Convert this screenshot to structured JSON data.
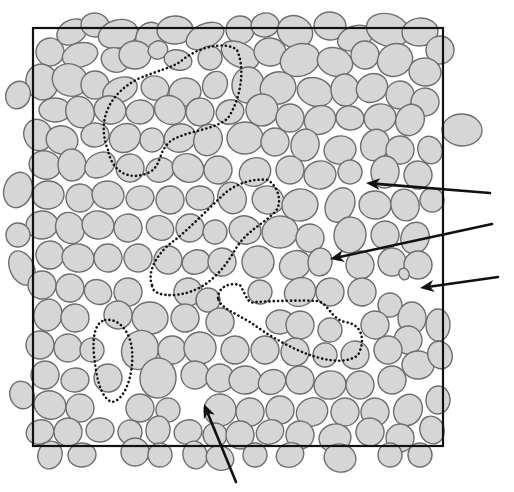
{
  "figure": {
    "width": 514,
    "height": 492,
    "colors": {
      "background": "#ffffff",
      "grain_fill": "#d6d6d6",
      "grain_stroke": "#6e6e6e",
      "frame": "#111111",
      "cluster_outline": "#151515",
      "arrow": "#111111"
    },
    "frame": {
      "x": 33,
      "y": 28,
      "width": 410,
      "height": 418
    },
    "clusters": [
      {
        "name": "cluster-top",
        "d": "M108,150 C96,120 110,92 140,78 C160,70 170,68 180,62 C195,48 225,40 237,50 C246,70 240,100 228,118 C215,130 190,130 172,140 C158,150 162,165 150,172 C130,182 112,172 108,150 Z"
      },
      {
        "name": "cluster-middle",
        "d": "M152,285 C146,270 160,250 175,240 C190,228 205,212 220,198 C232,185 250,178 268,180 C280,188 282,205 275,212 C262,225 245,232 235,250 C222,272 205,292 175,295 C160,296 152,292 152,285 Z"
      },
      {
        "name": "cluster-right",
        "d": "M218,298 C218,288 228,282 240,285 C246,295 248,305 255,302 C275,301 300,300 318,301 C330,305 330,318 345,322 C362,324 366,340 358,355 C345,365 325,360 310,355 C290,348 268,335 250,322 C235,313 220,308 218,298 Z"
      },
      {
        "name": "cluster-left-bottom",
        "d": "M105,320 C118,318 130,330 132,350 C134,375 125,400 112,402 C100,398 96,375 94,355 C92,335 96,322 105,320 Z"
      }
    ],
    "arrows": [
      {
        "name": "arrow-pore-upper-right",
        "x1": 490,
        "y1": 193,
        "x2": 366,
        "y2": 183
      },
      {
        "name": "arrow-pore-center-right",
        "x1": 492,
        "y1": 224,
        "x2": 330,
        "y2": 259
      },
      {
        "name": "arrow-pore-right-edge",
        "x1": 498,
        "y1": 277,
        "x2": 420,
        "y2": 288
      },
      {
        "name": "arrow-pore-bottom",
        "x1": 236,
        "y1": 482,
        "x2": 204,
        "y2": 404
      }
    ],
    "grains": [
      [
        72,
        32,
        16,
        12
      ],
      [
        95,
        25,
        14,
        12
      ],
      [
        118,
        34,
        20,
        14
      ],
      [
        150,
        38,
        14,
        16
      ],
      [
        175,
        30,
        18,
        14
      ],
      [
        205,
        36,
        20,
        12
      ],
      [
        240,
        30,
        14,
        14
      ],
      [
        265,
        25,
        14,
        12
      ],
      [
        295,
        32,
        18,
        16
      ],
      [
        330,
        26,
        16,
        14
      ],
      [
        355,
        38,
        18,
        12
      ],
      [
        388,
        30,
        22,
        16
      ],
      [
        420,
        32,
        18,
        14
      ],
      [
        440,
        50,
        14,
        14
      ],
      [
        50,
        52,
        14,
        14
      ],
      [
        80,
        55,
        18,
        12
      ],
      [
        115,
        60,
        14,
        12
      ],
      [
        135,
        55,
        16,
        14
      ],
      [
        158,
        50,
        10,
        9
      ],
      [
        178,
        60,
        14,
        10
      ],
      [
        210,
        58,
        12,
        12
      ],
      [
        240,
        55,
        20,
        12
      ],
      [
        270,
        52,
        16,
        14
      ],
      [
        300,
        60,
        20,
        16
      ],
      [
        335,
        62,
        18,
        14
      ],
      [
        365,
        55,
        14,
        14
      ],
      [
        395,
        60,
        18,
        16
      ],
      [
        425,
        72,
        16,
        14
      ],
      [
        42,
        82,
        16,
        18
      ],
      [
        70,
        80,
        18,
        16
      ],
      [
        95,
        85,
        14,
        14
      ],
      [
        120,
        90,
        18,
        12
      ],
      [
        155,
        88,
        14,
        12
      ],
      [
        185,
        92,
        16,
        14
      ],
      [
        215,
        85,
        12,
        14
      ],
      [
        248,
        85,
        16,
        18
      ],
      [
        278,
        88,
        18,
        16
      ],
      [
        315,
        92,
        18,
        14
      ],
      [
        345,
        90,
        14,
        16
      ],
      [
        372,
        88,
        16,
        14
      ],
      [
        400,
        95,
        14,
        14
      ],
      [
        425,
        102,
        14,
        14
      ],
      [
        18,
        95,
        12,
        14
      ],
      [
        55,
        110,
        16,
        12
      ],
      [
        80,
        112,
        14,
        16
      ],
      [
        110,
        110,
        16,
        14
      ],
      [
        140,
        112,
        14,
        12
      ],
      [
        170,
        110,
        16,
        14
      ],
      [
        200,
        112,
        14,
        14
      ],
      [
        230,
        112,
        14,
        12
      ],
      [
        262,
        110,
        16,
        16
      ],
      [
        290,
        118,
        14,
        14
      ],
      [
        320,
        120,
        16,
        14
      ],
      [
        350,
        118,
        14,
        12
      ],
      [
        380,
        118,
        16,
        14
      ],
      [
        410,
        120,
        14,
        16
      ],
      [
        462,
        130,
        20,
        16
      ],
      [
        38,
        135,
        14,
        16
      ],
      [
        62,
        140,
        16,
        14
      ],
      [
        95,
        135,
        14,
        12
      ],
      [
        125,
        138,
        16,
        14
      ],
      [
        152,
        140,
        12,
        12
      ],
      [
        180,
        138,
        16,
        14
      ],
      [
        208,
        140,
        14,
        16
      ],
      [
        245,
        138,
        18,
        16
      ],
      [
        275,
        142,
        14,
        14
      ],
      [
        305,
        145,
        14,
        16
      ],
      [
        340,
        150,
        16,
        14
      ],
      [
        375,
        145,
        14,
        16
      ],
      [
        400,
        150,
        14,
        14
      ],
      [
        430,
        150,
        12,
        14
      ],
      [
        45,
        165,
        16,
        14
      ],
      [
        72,
        165,
        14,
        16
      ],
      [
        100,
        165,
        16,
        12
      ],
      [
        130,
        168,
        14,
        14
      ],
      [
        160,
        170,
        14,
        12
      ],
      [
        188,
        168,
        16,
        14
      ],
      [
        218,
        170,
        14,
        14
      ],
      [
        255,
        172,
        16,
        14
      ],
      [
        290,
        170,
        14,
        14
      ],
      [
        320,
        175,
        16,
        14
      ],
      [
        350,
        172,
        12,
        12
      ],
      [
        385,
        172,
        14,
        16
      ],
      [
        418,
        175,
        14,
        14
      ],
      [
        18,
        190,
        14,
        18
      ],
      [
        48,
        195,
        16,
        14
      ],
      [
        80,
        198,
        14,
        14
      ],
      [
        108,
        195,
        16,
        14
      ],
      [
        140,
        198,
        14,
        12
      ],
      [
        170,
        200,
        14,
        14
      ],
      [
        200,
        198,
        14,
        12
      ],
      [
        232,
        198,
        14,
        16
      ],
      [
        268,
        200,
        16,
        14
      ],
      [
        300,
        205,
        18,
        16
      ],
      [
        340,
        205,
        14,
        18
      ],
      [
        375,
        205,
        16,
        14
      ],
      [
        405,
        205,
        14,
        16
      ],
      [
        432,
        200,
        12,
        12
      ],
      [
        42,
        225,
        16,
        14
      ],
      [
        70,
        228,
        14,
        16
      ],
      [
        98,
        225,
        16,
        14
      ],
      [
        128,
        228,
        14,
        14
      ],
      [
        160,
        228,
        14,
        12
      ],
      [
        190,
        228,
        14,
        14
      ],
      [
        215,
        232,
        12,
        12
      ],
      [
        245,
        230,
        16,
        14
      ],
      [
        280,
        232,
        18,
        16
      ],
      [
        310,
        238,
        14,
        14
      ],
      [
        350,
        235,
        16,
        18
      ],
      [
        385,
        235,
        14,
        14
      ],
      [
        415,
        238,
        14,
        16
      ],
      [
        18,
        235,
        12,
        12
      ],
      [
        50,
        255,
        14,
        14
      ],
      [
        78,
        258,
        16,
        14
      ],
      [
        108,
        258,
        14,
        14
      ],
      [
        138,
        258,
        14,
        14
      ],
      [
        168,
        260,
        14,
        14
      ],
      [
        196,
        262,
        14,
        12
      ],
      [
        222,
        262,
        14,
        14
      ],
      [
        258,
        262,
        16,
        16
      ],
      [
        295,
        265,
        16,
        14
      ],
      [
        320,
        262,
        12,
        14
      ],
      [
        360,
        265,
        14,
        14
      ],
      [
        392,
        262,
        14,
        14
      ],
      [
        418,
        265,
        14,
        14
      ],
      [
        22,
        268,
        12,
        18
      ],
      [
        42,
        285,
        14,
        14
      ],
      [
        70,
        288,
        14,
        14
      ],
      [
        98,
        292,
        14,
        12
      ],
      [
        128,
        292,
        14,
        14
      ],
      [
        188,
        292,
        14,
        14
      ],
      [
        208,
        300,
        12,
        12
      ],
      [
        260,
        292,
        12,
        12
      ],
      [
        300,
        292,
        16,
        14
      ],
      [
        330,
        292,
        14,
        14
      ],
      [
        362,
        292,
        14,
        14
      ],
      [
        390,
        305,
        12,
        12
      ],
      [
        412,
        318,
        14,
        16
      ],
      [
        404,
        274,
        5,
        6
      ],
      [
        48,
        315,
        14,
        16
      ],
      [
        75,
        318,
        14,
        14
      ],
      [
        118,
        315,
        14,
        14
      ],
      [
        150,
        318,
        18,
        16
      ],
      [
        185,
        318,
        14,
        14
      ],
      [
        220,
        322,
        14,
        14
      ],
      [
        280,
        322,
        14,
        12
      ],
      [
        300,
        325,
        14,
        14
      ],
      [
        330,
        330,
        12,
        12
      ],
      [
        375,
        325,
        14,
        14
      ],
      [
        408,
        340,
        14,
        14
      ],
      [
        438,
        325,
        12,
        16
      ],
      [
        40,
        345,
        14,
        14
      ],
      [
        68,
        348,
        14,
        14
      ],
      [
        92,
        350,
        12,
        12
      ],
      [
        140,
        350,
        18,
        20
      ],
      [
        172,
        350,
        14,
        14
      ],
      [
        200,
        348,
        16,
        16
      ],
      [
        235,
        350,
        14,
        14
      ],
      [
        265,
        350,
        14,
        14
      ],
      [
        295,
        352,
        14,
        14
      ],
      [
        325,
        355,
        12,
        12
      ],
      [
        355,
        355,
        14,
        14
      ],
      [
        388,
        350,
        14,
        14
      ],
      [
        418,
        365,
        16,
        14
      ],
      [
        440,
        355,
        12,
        14
      ],
      [
        45,
        375,
        14,
        14
      ],
      [
        75,
        380,
        14,
        12
      ],
      [
        108,
        378,
        14,
        14
      ],
      [
        158,
        378,
        18,
        20
      ],
      [
        195,
        375,
        14,
        14
      ],
      [
        220,
        378,
        14,
        14
      ],
      [
        245,
        380,
        16,
        14
      ],
      [
        272,
        382,
        14,
        12
      ],
      [
        300,
        380,
        14,
        14
      ],
      [
        330,
        385,
        16,
        14
      ],
      [
        360,
        385,
        14,
        14
      ],
      [
        392,
        380,
        14,
        14
      ],
      [
        22,
        395,
        12,
        14
      ],
      [
        50,
        405,
        16,
        14
      ],
      [
        80,
        408,
        14,
        14
      ],
      [
        140,
        408,
        14,
        14
      ],
      [
        168,
        410,
        12,
        12
      ],
      [
        220,
        410,
        16,
        16
      ],
      [
        250,
        412,
        14,
        14
      ],
      [
        280,
        410,
        14,
        14
      ],
      [
        312,
        412,
        16,
        14
      ],
      [
        345,
        412,
        14,
        14
      ],
      [
        375,
        412,
        14,
        14
      ],
      [
        408,
        410,
        14,
        16
      ],
      [
        438,
        400,
        12,
        14
      ],
      [
        40,
        432,
        14,
        12
      ],
      [
        68,
        432,
        14,
        14
      ],
      [
        100,
        430,
        14,
        12
      ],
      [
        130,
        432,
        12,
        12
      ],
      [
        158,
        430,
        12,
        14
      ],
      [
        188,
        432,
        14,
        12
      ],
      [
        215,
        435,
        12,
        12
      ],
      [
        240,
        435,
        14,
        14
      ],
      [
        270,
        432,
        14,
        12
      ],
      [
        300,
        435,
        14,
        14
      ],
      [
        335,
        438,
        16,
        14
      ],
      [
        370,
        432,
        14,
        14
      ],
      [
        400,
        438,
        14,
        14
      ],
      [
        432,
        430,
        12,
        14
      ],
      [
        50,
        455,
        12,
        14
      ],
      [
        82,
        455,
        14,
        12
      ],
      [
        135,
        452,
        14,
        14
      ],
      [
        160,
        455,
        12,
        12
      ],
      [
        195,
        455,
        12,
        14
      ],
      [
        220,
        458,
        14,
        12
      ],
      [
        255,
        455,
        12,
        12
      ],
      [
        290,
        455,
        14,
        12
      ],
      [
        340,
        458,
        16,
        14
      ],
      [
        390,
        455,
        12,
        12
      ],
      [
        420,
        455,
        12,
        12
      ]
    ]
  }
}
